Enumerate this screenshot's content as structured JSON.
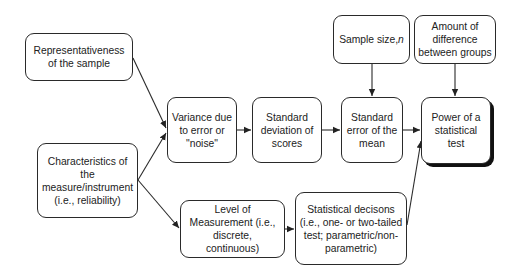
{
  "diagram": {
    "nodes": {
      "representativeness": "Representativeness\nof the sample",
      "characteristics": "Characteristics of\nthe\nmeasure/instrument\n(i.e., reliability)",
      "variance": "Variance due\nto error or\n\"noise\"",
      "std_deviation": "Standard\ndeviation of\nscores",
      "std_error": "Standard\nerror of the\nmean",
      "power": "Power of a\nstatistical\ntest",
      "sample_size_prefix": "Sample size, ",
      "sample_size_var": "n",
      "amount_difference": "Amount of\ndifference\nbetween groups",
      "level_measurement": "Level of\nMeasurement (i.e.,\ndiscrete,\ncontinuous)",
      "statistical_decisions": "Statistical decisons\n(i.e., one- or two-tailed\ntest; parametric/non-\nparametric)"
    },
    "edges": [
      {
        "from": "representativeness",
        "to": "variance"
      },
      {
        "from": "characteristics",
        "to": "variance"
      },
      {
        "from": "characteristics",
        "to": "level_measurement"
      },
      {
        "from": "variance",
        "to": "std_deviation"
      },
      {
        "from": "std_deviation",
        "to": "std_error"
      },
      {
        "from": "sample_size",
        "to": "std_error"
      },
      {
        "from": "std_error",
        "to": "power"
      },
      {
        "from": "amount_difference",
        "to": "power"
      },
      {
        "from": "level_measurement",
        "to": "statistical_decisions"
      },
      {
        "from": "statistical_decisions",
        "to": "power"
      }
    ]
  }
}
